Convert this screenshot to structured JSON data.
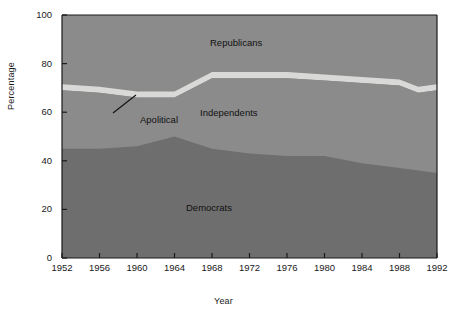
{
  "chart_data": {
    "type": "area",
    "title": "",
    "xlabel": "Year",
    "ylabel": "Percentage",
    "xlim": [
      1952,
      1992
    ],
    "ylim": [
      0,
      100
    ],
    "grid": false,
    "stacked": true,
    "legend_position": "inline-annotations",
    "x": [
      1952,
      1956,
      1960,
      1964,
      1968,
      1972,
      1976,
      1980,
      1984,
      1988,
      1990,
      1992
    ],
    "xticks": [
      "1952",
      "1956",
      "1960",
      "1964",
      "1968",
      "1972",
      "1976",
      "1980",
      "1984",
      "1988",
      "1992"
    ],
    "yticks": [
      "0",
      "20",
      "40",
      "60",
      "80",
      "100"
    ],
    "series": [
      {
        "name": "Democrats",
        "color": "#6e6e6e",
        "values": [
          45,
          45,
          46,
          50,
          45,
          43,
          42,
          42,
          39,
          37,
          36,
          35
        ]
      },
      {
        "name": "Independents",
        "color": "#8b8b8b",
        "values": [
          24,
          23,
          20,
          16,
          29,
          31,
          32,
          31,
          33,
          34,
          32,
          34
        ]
      },
      {
        "name": "Apolitical",
        "color": "#d9d9d7",
        "values": [
          2.5,
          2.5,
          2.5,
          2.5,
          2.5,
          2.5,
          2.5,
          2.5,
          2.5,
          2.5,
          2.5,
          2.5
        ]
      },
      {
        "name": "Republicans",
        "color": "#8b8b8b",
        "values": [
          28.5,
          29.5,
          31.5,
          31.5,
          23.5,
          23.5,
          23.5,
          24.5,
          25.5,
          26.5,
          29.5,
          28.5
        ]
      }
    ],
    "cumulative_tops": {
      "democrats": [
        45,
        45,
        46,
        50,
        45,
        43,
        42,
        42,
        39,
        37,
        36,
        35
      ],
      "independents": [
        69,
        68,
        66,
        66,
        74,
        74,
        74,
        73,
        72,
        71,
        68,
        69
      ],
      "apolitical": [
        71.5,
        70.5,
        68.5,
        68.5,
        76.5,
        76.5,
        76.5,
        75.5,
        74.5,
        73.5,
        70.5,
        71.5
      ]
    },
    "annotations": [
      {
        "name": "Republicans",
        "x_px": 210,
        "y_px": 37
      },
      {
        "name": "Independents",
        "x_px": 200,
        "y_px": 107
      },
      {
        "name": "Democrats",
        "x_px": 186,
        "y_px": 202
      },
      {
        "name": "Apolitical",
        "x_px": 140,
        "y_px": 114
      }
    ],
    "leader_line": {
      "x1": 136,
      "y1": 95,
      "x2": 113,
      "y2": 113
    }
  },
  "axes": {
    "ylabel": "Percentage",
    "xlabel": "Year",
    "yticks": [
      {
        "label": "100",
        "value": 100
      },
      {
        "label": "80",
        "value": 80
      },
      {
        "label": "60",
        "value": 60
      },
      {
        "label": "40",
        "value": 40
      },
      {
        "label": "20",
        "value": 20
      },
      {
        "label": "0",
        "value": 0
      }
    ],
    "xticks": [
      {
        "label": "1952",
        "value": 1952
      },
      {
        "label": "1956",
        "value": 1956
      },
      {
        "label": "1960",
        "value": 1960
      },
      {
        "label": "1964",
        "value": 1964
      },
      {
        "label": "1968",
        "value": 1968
      },
      {
        "label": "1972",
        "value": 1972
      },
      {
        "label": "1976",
        "value": 1976
      },
      {
        "label": "1980",
        "value": 1980
      },
      {
        "label": "1984",
        "value": 1984
      },
      {
        "label": "1988",
        "value": 1988
      },
      {
        "label": "1992",
        "value": 1992
      }
    ]
  },
  "labels": {
    "republicans": "Republicans",
    "independents": "Independents",
    "apolitical": "Apolitical",
    "democrats": "Democrats"
  },
  "colors": {
    "democrats": "#6e6e6e",
    "independents": "#8b8b8b",
    "republicans": "#8b8b8b",
    "apolitical": "#d9d9d7",
    "axis": "#1a1a1a",
    "background": "#ffffff"
  }
}
